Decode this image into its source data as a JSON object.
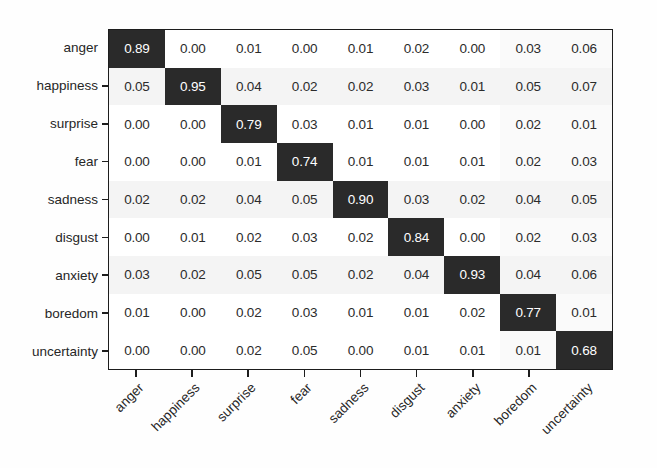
{
  "figure": {
    "type": "confusion-matrix-heatmap",
    "background_color": "#fefefe",
    "axis_color": "#1d1d1d",
    "diagonal_cell_color": "#2a2a2a",
    "diagonal_text_color": "#ffffff",
    "offdiagonal_cell_color": "#ffffff",
    "offdiagonal_text_color": "#2b2b2b"
  },
  "chart_data": {
    "type": "heatmap",
    "title": "",
    "xlabel": "",
    "ylabel": "",
    "legend": null,
    "grid": false,
    "xtick_rotation": -45,
    "categories": [
      "anger",
      "happiness",
      "surprise",
      "fear",
      "sadness",
      "disgust",
      "anxiety",
      "boredom",
      "uncertainty"
    ],
    "row_labels": [
      "anger",
      "happiness",
      "surprise",
      "fear",
      "sadness",
      "disgust",
      "anxiety",
      "boredom",
      "uncertainty"
    ],
    "column_labels": [
      "anger",
      "happiness",
      "surprise",
      "fear",
      "sadness",
      "disgust",
      "anxiety",
      "boredom",
      "uncertainty"
    ],
    "zlim": [
      0.0,
      1.0
    ],
    "cell_text_format": "0.00",
    "values": [
      [
        0.89,
        0.0,
        0.01,
        0.0,
        0.01,
        0.02,
        0.0,
        0.03,
        0.06
      ],
      [
        0.05,
        0.95,
        0.04,
        0.02,
        0.02,
        0.03,
        0.01,
        0.05,
        0.07
      ],
      [
        0.0,
        0.0,
        0.79,
        0.03,
        0.01,
        0.01,
        0.0,
        0.02,
        0.01
      ],
      [
        0.0,
        0.0,
        0.01,
        0.74,
        0.01,
        0.01,
        0.01,
        0.02,
        0.03
      ],
      [
        0.02,
        0.02,
        0.04,
        0.05,
        0.9,
        0.03,
        0.02,
        0.04,
        0.05
      ],
      [
        0.0,
        0.01,
        0.02,
        0.03,
        0.02,
        0.84,
        0.0,
        0.02,
        0.03
      ],
      [
        0.03,
        0.02,
        0.05,
        0.05,
        0.02,
        0.04,
        0.93,
        0.04,
        0.06
      ],
      [
        0.01,
        0.0,
        0.02,
        0.03,
        0.01,
        0.01,
        0.02,
        0.77,
        0.01
      ],
      [
        0.0,
        0.0,
        0.02,
        0.05,
        0.0,
        0.01,
        0.01,
        0.01,
        0.68
      ]
    ],
    "cells": [
      {
        "row": "anger",
        "col": "anger",
        "value": "0.89",
        "diagonal": true
      },
      {
        "row": "anger",
        "col": "happiness",
        "value": "0.00",
        "diagonal": false
      },
      {
        "row": "anger",
        "col": "surprise",
        "value": "0.01",
        "diagonal": false
      },
      {
        "row": "anger",
        "col": "fear",
        "value": "0.00",
        "diagonal": false
      },
      {
        "row": "anger",
        "col": "sadness",
        "value": "0.01",
        "diagonal": false
      },
      {
        "row": "anger",
        "col": "disgust",
        "value": "0.02",
        "diagonal": false
      },
      {
        "row": "anger",
        "col": "anxiety",
        "value": "0.00",
        "diagonal": false
      },
      {
        "row": "anger",
        "col": "boredom",
        "value": "0.03",
        "diagonal": false
      },
      {
        "row": "anger",
        "col": "uncertainty",
        "value": "0.06",
        "diagonal": false
      },
      {
        "row": "happiness",
        "col": "anger",
        "value": "0.05",
        "diagonal": false
      },
      {
        "row": "happiness",
        "col": "happiness",
        "value": "0.95",
        "diagonal": true
      },
      {
        "row": "happiness",
        "col": "surprise",
        "value": "0.04",
        "diagonal": false
      },
      {
        "row": "happiness",
        "col": "fear",
        "value": "0.02",
        "diagonal": false
      },
      {
        "row": "happiness",
        "col": "sadness",
        "value": "0.02",
        "diagonal": false
      },
      {
        "row": "happiness",
        "col": "disgust",
        "value": "0.03",
        "diagonal": false
      },
      {
        "row": "happiness",
        "col": "anxiety",
        "value": "0.01",
        "diagonal": false
      },
      {
        "row": "happiness",
        "col": "boredom",
        "value": "0.05",
        "diagonal": false
      },
      {
        "row": "happiness",
        "col": "uncertainty",
        "value": "0.07",
        "diagonal": false
      },
      {
        "row": "surprise",
        "col": "anger",
        "value": "0.00",
        "diagonal": false
      },
      {
        "row": "surprise",
        "col": "happiness",
        "value": "0.00",
        "diagonal": false
      },
      {
        "row": "surprise",
        "col": "surprise",
        "value": "0.79",
        "diagonal": true
      },
      {
        "row": "surprise",
        "col": "fear",
        "value": "0.03",
        "diagonal": false
      },
      {
        "row": "surprise",
        "col": "sadness",
        "value": "0.01",
        "diagonal": false
      },
      {
        "row": "surprise",
        "col": "disgust",
        "value": "0.01",
        "diagonal": false
      },
      {
        "row": "surprise",
        "col": "anxiety",
        "value": "0.00",
        "diagonal": false
      },
      {
        "row": "surprise",
        "col": "boredom",
        "value": "0.02",
        "diagonal": false
      },
      {
        "row": "surprise",
        "col": "uncertainty",
        "value": "0.01",
        "diagonal": false
      },
      {
        "row": "fear",
        "col": "anger",
        "value": "0.00",
        "diagonal": false
      },
      {
        "row": "fear",
        "col": "happiness",
        "value": "0.00",
        "diagonal": false
      },
      {
        "row": "fear",
        "col": "surprise",
        "value": "0.01",
        "diagonal": false
      },
      {
        "row": "fear",
        "col": "fear",
        "value": "0.74",
        "diagonal": true
      },
      {
        "row": "fear",
        "col": "sadness",
        "value": "0.01",
        "diagonal": false
      },
      {
        "row": "fear",
        "col": "disgust",
        "value": "0.01",
        "diagonal": false
      },
      {
        "row": "fear",
        "col": "anxiety",
        "value": "0.01",
        "diagonal": false
      },
      {
        "row": "fear",
        "col": "boredom",
        "value": "0.02",
        "diagonal": false
      },
      {
        "row": "fear",
        "col": "uncertainty",
        "value": "0.03",
        "diagonal": false
      },
      {
        "row": "sadness",
        "col": "anger",
        "value": "0.02",
        "diagonal": false
      },
      {
        "row": "sadness",
        "col": "happiness",
        "value": "0.02",
        "diagonal": false
      },
      {
        "row": "sadness",
        "col": "surprise",
        "value": "0.04",
        "diagonal": false
      },
      {
        "row": "sadness",
        "col": "fear",
        "value": "0.05",
        "diagonal": false
      },
      {
        "row": "sadness",
        "col": "sadness",
        "value": "0.90",
        "diagonal": true
      },
      {
        "row": "sadness",
        "col": "disgust",
        "value": "0.03",
        "diagonal": false
      },
      {
        "row": "sadness",
        "col": "anxiety",
        "value": "0.02",
        "diagonal": false
      },
      {
        "row": "sadness",
        "col": "boredom",
        "value": "0.04",
        "diagonal": false
      },
      {
        "row": "sadness",
        "col": "uncertainty",
        "value": "0.05",
        "diagonal": false
      },
      {
        "row": "disgust",
        "col": "anger",
        "value": "0.00",
        "diagonal": false
      },
      {
        "row": "disgust",
        "col": "happiness",
        "value": "0.01",
        "diagonal": false
      },
      {
        "row": "disgust",
        "col": "surprise",
        "value": "0.02",
        "diagonal": false
      },
      {
        "row": "disgust",
        "col": "fear",
        "value": "0.03",
        "diagonal": false
      },
      {
        "row": "disgust",
        "col": "sadness",
        "value": "0.02",
        "diagonal": false
      },
      {
        "row": "disgust",
        "col": "disgust",
        "value": "0.84",
        "diagonal": true
      },
      {
        "row": "disgust",
        "col": "anxiety",
        "value": "0.00",
        "diagonal": false
      },
      {
        "row": "disgust",
        "col": "boredom",
        "value": "0.02",
        "diagonal": false
      },
      {
        "row": "disgust",
        "col": "uncertainty",
        "value": "0.03",
        "diagonal": false
      },
      {
        "row": "anxiety",
        "col": "anger",
        "value": "0.03",
        "diagonal": false
      },
      {
        "row": "anxiety",
        "col": "happiness",
        "value": "0.02",
        "diagonal": false
      },
      {
        "row": "anxiety",
        "col": "surprise",
        "value": "0.05",
        "diagonal": false
      },
      {
        "row": "anxiety",
        "col": "fear",
        "value": "0.05",
        "diagonal": false
      },
      {
        "row": "anxiety",
        "col": "sadness",
        "value": "0.02",
        "diagonal": false
      },
      {
        "row": "anxiety",
        "col": "disgust",
        "value": "0.04",
        "diagonal": false
      },
      {
        "row": "anxiety",
        "col": "anxiety",
        "value": "0.93",
        "diagonal": true
      },
      {
        "row": "anxiety",
        "col": "boredom",
        "value": "0.04",
        "diagonal": false
      },
      {
        "row": "anxiety",
        "col": "uncertainty",
        "value": "0.06",
        "diagonal": false
      },
      {
        "row": "boredom",
        "col": "anger",
        "value": "0.01",
        "diagonal": false
      },
      {
        "row": "boredom",
        "col": "happiness",
        "value": "0.00",
        "diagonal": false
      },
      {
        "row": "boredom",
        "col": "surprise",
        "value": "0.02",
        "diagonal": false
      },
      {
        "row": "boredom",
        "col": "fear",
        "value": "0.03",
        "diagonal": false
      },
      {
        "row": "boredom",
        "col": "sadness",
        "value": "0.01",
        "diagonal": false
      },
      {
        "row": "boredom",
        "col": "disgust",
        "value": "0.01",
        "diagonal": false
      },
      {
        "row": "boredom",
        "col": "anxiety",
        "value": "0.02",
        "diagonal": false
      },
      {
        "row": "boredom",
        "col": "boredom",
        "value": "0.77",
        "diagonal": true
      },
      {
        "row": "boredom",
        "col": "uncertainty",
        "value": "0.01",
        "diagonal": false
      },
      {
        "row": "uncertainty",
        "col": "anger",
        "value": "0.00",
        "diagonal": false
      },
      {
        "row": "uncertainty",
        "col": "happiness",
        "value": "0.00",
        "diagonal": false
      },
      {
        "row": "uncertainty",
        "col": "surprise",
        "value": "0.02",
        "diagonal": false
      },
      {
        "row": "uncertainty",
        "col": "fear",
        "value": "0.05",
        "diagonal": false
      },
      {
        "row": "uncertainty",
        "col": "sadness",
        "value": "0.00",
        "diagonal": false
      },
      {
        "row": "uncertainty",
        "col": "disgust",
        "value": "0.01",
        "diagonal": false
      },
      {
        "row": "uncertainty",
        "col": "anxiety",
        "value": "0.01",
        "diagonal": false
      },
      {
        "row": "uncertainty",
        "col": "boredom",
        "value": "0.01",
        "diagonal": false
      },
      {
        "row": "uncertainty",
        "col": "uncertainty",
        "value": "0.68",
        "diagonal": true
      }
    ]
  }
}
